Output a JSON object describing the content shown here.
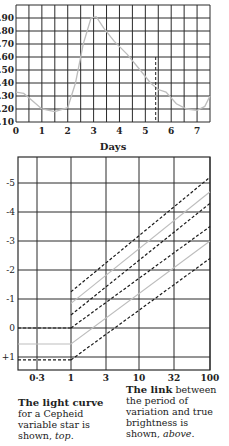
{
  "chart_data": [
    {
      "type": "line",
      "title": "Light curve of a Cepheid variable star",
      "xlabel": "Days",
      "ylabel": "",
      "xlim": [
        0,
        7.5
      ],
      "ylim": [
        0.1,
        1.0
      ],
      "grid": true,
      "x_ticks": [
        "0",
        "1",
        "2",
        "3",
        "4",
        "5",
        "6",
        "7"
      ],
      "y_ticks": [
        ".90",
        ".80",
        ".70",
        ".60",
        ".50",
        ".40",
        ".30",
        ".20",
        ".10"
      ],
      "series": [
        {
          "name": "brightness",
          "x": [
            0,
            0.3,
            0.6,
            1.0,
            1.5,
            2.0,
            2.3,
            2.6,
            2.9,
            3.1,
            3.4,
            3.8,
            4.3,
            4.8,
            5.2,
            5.5,
            5.8,
            6.2,
            6.6,
            7.0,
            7.3,
            7.5
          ],
          "values": [
            0.33,
            0.32,
            0.27,
            0.2,
            0.18,
            0.21,
            0.4,
            0.7,
            0.9,
            0.91,
            0.82,
            0.72,
            0.62,
            0.5,
            0.4,
            0.35,
            0.33,
            0.24,
            0.2,
            0.19,
            0.22,
            0.3
          ]
        }
      ],
      "annotations": [
        {
          "type": "vertical-dashed-line",
          "x": 5.4,
          "from": 0.1,
          "to": 0.6
        }
      ]
    },
    {
      "type": "line",
      "title": "Period–luminosity relation",
      "xlabel": "Period (days, log scale)",
      "ylabel": "Absolute magnitude",
      "x_ticks": [
        "0·3",
        "1",
        "3",
        "10",
        "32",
        "100"
      ],
      "y_ticks": [
        "-5",
        "-4",
        "-3",
        "-2",
        "-1",
        "0",
        "+1"
      ],
      "grid": true,
      "series": [
        {
          "name": "upper bound (dashed)",
          "style": "dashed",
          "x": [
            1,
            100
          ],
          "values": [
            -1.25,
            -5.2
          ]
        },
        {
          "name": "upper mean (gray)",
          "style": "solid-gray",
          "x": [
            1,
            100
          ],
          "values": [
            -0.85,
            -4.7
          ]
        },
        {
          "name": "upper lower-bound (dashed)",
          "style": "dashed",
          "x": [
            1,
            100
          ],
          "values": [
            -0.45,
            -4.3
          ]
        },
        {
          "name": "lower upper-bound (dashed)",
          "style": "dashed",
          "x": [
            1,
            100
          ],
          "values": [
            0.0,
            -3.5
          ]
        },
        {
          "name": "lower mean (gray)",
          "style": "solid-gray",
          "x": [
            0.1,
            1,
            100
          ],
          "values": [
            0.55,
            0.55,
            -3.0
          ]
        },
        {
          "name": "lower bound (dashed)",
          "style": "dashed",
          "x": [
            1,
            100
          ],
          "values": [
            1.1,
            -2.4
          ]
        }
      ],
      "annotations": [
        {
          "type": "horizontal-dashed-line",
          "y": 0,
          "from_x": 0.1,
          "to_x": 1
        },
        {
          "type": "horizontal-dashed-line",
          "y": 1.1,
          "from_x": 0.1,
          "to_x": 1
        }
      ]
    }
  ],
  "top_chart": {
    "y_labels": [
      ".90",
      ".80",
      ".70",
      ".60",
      ".50",
      ".40",
      ".30",
      ".20",
      ".10"
    ],
    "x_labels": [
      "0",
      "1",
      "2",
      "3",
      "4",
      "5",
      "6",
      "7"
    ],
    "x_title": "Days"
  },
  "bottom_chart": {
    "y_labels": [
      "-5",
      "-4",
      "-3",
      "-2",
      "-1",
      "0",
      "+1"
    ],
    "x_labels": [
      "0·3",
      "1",
      "3",
      "10",
      "32",
      "100"
    ]
  },
  "captions": {
    "left": {
      "bold": "The light curve",
      "text": "for a Cepheid variable star is shown,",
      "italic": "top",
      "end": "."
    },
    "right": {
      "bold": "The link",
      "text": "between the period of variation and true brightness is shown,",
      "italic": "above",
      "end": "."
    }
  },
  "colors": {
    "grid": "#2a2a2a",
    "curve": "#bdbdbd",
    "dashed": "#1a1a1a"
  }
}
